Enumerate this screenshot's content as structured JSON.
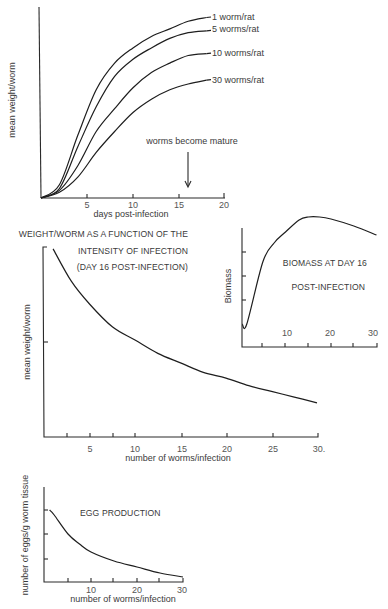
{
  "chart_data": [
    {
      "id": "growth",
      "type": "line",
      "title": "",
      "xlabel": "days post-infection",
      "ylabel": "mean weight/worm",
      "xlim": [
        0,
        20
      ],
      "ylim": [
        0,
        100
      ],
      "x_ticks": [
        5,
        10,
        15,
        20
      ],
      "x_tick_labels": [
        "5",
        "10",
        "15",
        "20"
      ],
      "grid": false,
      "x": [
        0,
        2,
        4,
        6,
        8,
        10,
        12,
        14,
        16,
        18
      ],
      "series": [
        {
          "name": "1 worm/rat",
          "values": [
            0,
            7,
            33,
            57,
            71,
            79,
            85,
            89,
            93,
            95
          ]
        },
        {
          "name": "5 worms/rat",
          "values": [
            0,
            5,
            27,
            48,
            64,
            73,
            79,
            84,
            87,
            88
          ]
        },
        {
          "name": "10 worms/rat",
          "values": [
            0,
            4,
            17,
            35,
            47,
            58,
            66,
            71,
            75,
            76
          ]
        },
        {
          "name": "30 worms/rat",
          "values": [
            0,
            3,
            11,
            24,
            35,
            45,
            52,
            57,
            60,
            62
          ]
        }
      ],
      "annotations": [
        {
          "text": "worms become mature",
          "x": 16,
          "type": "arrow-down"
        }
      ]
    },
    {
      "id": "weight_vs_intensity",
      "type": "line",
      "title": "WEIGHT/WORM AS A FUNCTION OF THE INTENSITY OF INFECTION (DAY 16 POST-INFECTION)",
      "xlabel": "number of worms/infection",
      "ylabel": "mean weight/worm",
      "xlim": [
        0,
        30
      ],
      "ylim": [
        0,
        100
      ],
      "x_ticks": [
        2.5,
        5,
        7.5,
        10,
        15,
        20,
        25,
        30
      ],
      "x_tick_labels": [
        "5",
        "10",
        "15",
        "20",
        "25",
        "30."
      ],
      "y_ticks": [
        50,
        100
      ],
      "grid": false,
      "x": [
        1,
        3,
        5,
        7.5,
        10,
        12.5,
        15,
        17.5,
        20,
        22.5,
        25,
        27.5,
        30
      ],
      "series": [
        {
          "name": "mean weight/worm",
          "values": [
            99,
            82,
            70,
            58,
            51,
            44,
            39,
            34,
            31,
            27,
            24,
            21,
            18
          ]
        }
      ]
    },
    {
      "id": "biomass",
      "type": "line",
      "title": "BIOMASS AT DAY 16 POST-INFECTION",
      "xlabel": "",
      "ylabel": "Biomass",
      "xlim": [
        0,
        30
      ],
      "ylim": [
        0,
        119
      ],
      "x_ticks": [
        5,
        10,
        15,
        20,
        25,
        30
      ],
      "x_tick_labels": [
        "10",
        "20",
        "30"
      ],
      "y_ticks": [
        47,
        71,
        95
      ],
      "grid": false,
      "x": [
        0.5,
        1.5,
        5,
        7.5,
        10,
        13,
        15,
        17.5,
        20,
        25,
        30
      ],
      "series": [
        {
          "name": "Biomass",
          "values": [
            23,
            23,
            85,
            104,
            115,
            127,
            130,
            130,
            128,
            121,
            112
          ]
        }
      ]
    },
    {
      "id": "egg_production",
      "type": "line",
      "title": "EGG PRODUCTION",
      "xlabel": "number of worms/infection",
      "ylabel": "number of eggs/g worm tissue",
      "xlim": [
        0,
        30
      ],
      "ylim": [
        0,
        95
      ],
      "x_ticks": [
        5,
        10,
        15,
        20,
        25,
        30
      ],
      "x_tick_labels": [
        "10",
        "20",
        "30"
      ],
      "y_ticks": [
        23,
        48,
        72
      ],
      "grid": false,
      "x": [
        1,
        2,
        5,
        7.5,
        10,
        15,
        20,
        25,
        30
      ],
      "series": [
        {
          "name": "eggs/g worm tissue",
          "values": [
            72,
            67,
            48,
            38,
            30,
            21,
            15,
            9,
            5
          ]
        }
      ]
    }
  ],
  "growth": {
    "ylabel": "mean weight/worm",
    "xlabel": "days post-infection",
    "ticks": [
      "5",
      "10",
      "15",
      "20"
    ],
    "legend": [
      "1 worm/rat",
      "5 worms/rat",
      "10 worms/rat",
      "30 worms/rat"
    ],
    "annotation": "worms become mature"
  },
  "intensity": {
    "title_line1": "WEIGHT/WORM AS A FUNCTION OF THE",
    "title_line2": "INTENSITY OF INFECTION",
    "title_line3": "(DAY 16 POST-INFECTION)",
    "ylabel": "mean weight/worm",
    "xlabel": "number of worms/infection",
    "ticks": [
      "5",
      "10",
      "15",
      "20",
      "25",
      "30."
    ]
  },
  "biomass": {
    "ylabel": "Biomass",
    "title_line1": "BIOMASS AT DAY 16",
    "title_line2": "POST-INFECTION",
    "ticks": [
      "10",
      "20",
      "30"
    ]
  },
  "egg": {
    "title": "EGG PRODUCTION",
    "ylabel": "number of eggs/g worm tissue",
    "xlabel": "number of worms/infection",
    "ticks": [
      "10",
      "20",
      "30"
    ]
  }
}
